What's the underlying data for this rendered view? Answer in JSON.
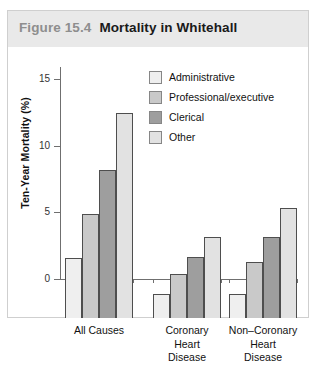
{
  "figure": {
    "number": "Figure 15.4",
    "title": "Mortality in Whitehall"
  },
  "chart_data": {
    "type": "bar",
    "title": "Mortality in Whitehall",
    "xlabel": "",
    "ylabel": "Ten-Year Mortality (%)",
    "ylim": [
      0,
      16
    ],
    "yticks": [
      0,
      5,
      10,
      15
    ],
    "ytick_labels": [
      "0",
      "5",
      "10",
      "15"
    ],
    "grid": false,
    "legend_position": "upper-center-inside",
    "categories": [
      "All Causes",
      "Coronary Heart Disease",
      "Non-Coronary Heart Disease"
    ],
    "category_lines": [
      [
        "All Causes"
      ],
      [
        "Coronary",
        "Heart",
        "Disease"
      ],
      [
        "Non–Coronary",
        "Heart",
        "Disease"
      ]
    ],
    "series": [
      {
        "name": "Administrative",
        "color": "#efefef",
        "values": [
          4.5,
          1.8,
          1.8
        ]
      },
      {
        "name": "Professional/executive",
        "color": "#c9c9c9",
        "values": [
          7.8,
          3.3,
          4.2
        ]
      },
      {
        "name": "Clerical",
        "color": "#9e9e9e",
        "values": [
          11.1,
          4.6,
          6.1
        ]
      },
      {
        "name": "Other",
        "color": "#e2e2e2",
        "values": [
          15.4,
          6.1,
          8.3
        ]
      }
    ]
  },
  "colors": {
    "header_band": "#e9e9e9",
    "frame_border": "#cfcfcf",
    "axis": "#6f6f6f",
    "bar_outline": "#4e4e4e",
    "figure_number_text": "#8e8e8e",
    "title_text": "#1a1a1a"
  }
}
